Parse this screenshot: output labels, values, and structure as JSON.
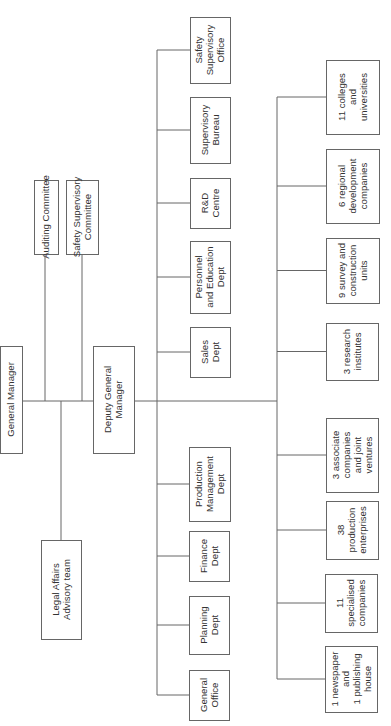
{
  "diagram": {
    "type": "org-chart",
    "orientation": "rotated-counterclockwise",
    "root": {
      "id": "gm",
      "label": [
        "General Manager"
      ]
    },
    "advisory_bodies": [
      {
        "id": "auditing",
        "label": [
          "Auditing Committee"
        ]
      },
      {
        "id": "safety-committee",
        "label": [
          "Safety Supervisory",
          "Committee"
        ]
      },
      {
        "id": "legal",
        "label": [
          "Legal Affairs",
          "Advisory team"
        ]
      }
    ],
    "deputy": {
      "id": "dgm",
      "label": [
        "Deputy General",
        "Manager"
      ]
    },
    "departments": [
      {
        "id": "safety-office",
        "label": [
          "Safety",
          "Supervisory",
          "Office"
        ]
      },
      {
        "id": "supervisory-bureau",
        "label": [
          "Supervisory",
          "Bureau"
        ]
      },
      {
        "id": "rd-centre",
        "label": [
          "R&D",
          "Centre"
        ]
      },
      {
        "id": "personnel",
        "label": [
          "Personnel",
          "and Education",
          "Dept"
        ]
      },
      {
        "id": "sales",
        "label": [
          "Sales",
          "Dept"
        ]
      },
      {
        "id": "production-mgmt",
        "label": [
          "Production",
          "Management",
          "Dept"
        ]
      },
      {
        "id": "finance",
        "label": [
          "Finance",
          "Dept"
        ]
      },
      {
        "id": "planning",
        "label": [
          "Planning",
          "Dept"
        ]
      },
      {
        "id": "general-office",
        "label": [
          "General",
          "Office"
        ]
      }
    ],
    "subsidiaries": [
      {
        "id": "colleges",
        "label": [
          "11 colleges",
          "and",
          "universities"
        ]
      },
      {
        "id": "regional-dev",
        "label": [
          "6 regional",
          "development",
          "companies"
        ]
      },
      {
        "id": "survey",
        "label": [
          "9 survey and",
          "construction",
          "units"
        ]
      },
      {
        "id": "research",
        "label": [
          "3 research",
          "institutes"
        ]
      },
      {
        "id": "associates",
        "label": [
          "3 associate",
          "companies",
          "and joint",
          "ventures"
        ]
      },
      {
        "id": "production-ent",
        "label": [
          "38",
          "production",
          "enterprises"
        ]
      },
      {
        "id": "specialised",
        "label": [
          "11",
          "specialised",
          "companies"
        ]
      },
      {
        "id": "newspaper",
        "label": [
          "1 newspaper",
          "and",
          "1 publishing",
          "house"
        ]
      }
    ]
  }
}
